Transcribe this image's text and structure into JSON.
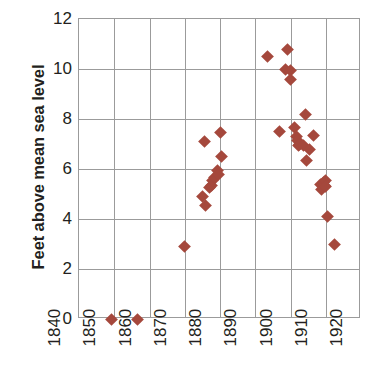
{
  "chart_data": {
    "type": "scatter",
    "title": "",
    "subtitle": "",
    "xlabel": "",
    "ylabel": "Feet above mean sea level",
    "xlim": [
      1840,
      1920
    ],
    "ylim": [
      0,
      12
    ],
    "xticks": [
      1840,
      1850,
      1860,
      1870,
      1880,
      1890,
      1900,
      1910,
      1920
    ],
    "yticks": [
      0,
      2,
      4,
      6,
      8,
      10,
      12
    ],
    "xtick_labels": [
      "1840",
      "1850",
      "1860",
      "1870",
      "1880",
      "1890",
      "1900",
      "1910",
      "1920"
    ],
    "ytick_labels": [
      "0",
      "2",
      "4",
      "6",
      "8",
      "10",
      "12"
    ],
    "grid": true,
    "legend": false,
    "legend_position": "none",
    "marker": "diamond",
    "marker_color": "#a5483c",
    "axis_color": "#9b9b9b",
    "text_color": "#231f20",
    "series": [
      {
        "name": "Lake level observations",
        "color": "#a5483c",
        "points": [
          [
            1849.2,
            0.0
          ],
          [
            1856.6,
            0.0
          ],
          [
            1869.8,
            2.9
          ],
          [
            1875.0,
            4.9
          ],
          [
            1875.6,
            7.1
          ],
          [
            1875.8,
            4.55
          ],
          [
            1877.0,
            5.25
          ],
          [
            1877.6,
            5.35
          ],
          [
            1878.0,
            5.55
          ],
          [
            1878.5,
            5.65
          ],
          [
            1879.2,
            5.95
          ],
          [
            1879.5,
            5.8
          ],
          [
            1880.0,
            7.45
          ],
          [
            1880.3,
            6.5
          ],
          [
            1893.5,
            10.5
          ],
          [
            1897.0,
            7.5
          ],
          [
            1898.5,
            10.0
          ],
          [
            1899.2,
            10.8
          ],
          [
            1900.0,
            9.95
          ],
          [
            1900.1,
            9.6
          ],
          [
            1901.2,
            7.65
          ],
          [
            1901.6,
            7.3
          ],
          [
            1902.0,
            7.15
          ],
          [
            1902.3,
            6.95
          ],
          [
            1902.6,
            7.0
          ],
          [
            1904.2,
            8.2
          ],
          [
            1903.8,
            6.95
          ],
          [
            1904.6,
            6.35
          ],
          [
            1905.4,
            6.8
          ],
          [
            1906.4,
            7.35
          ],
          [
            1908.6,
            5.4
          ],
          [
            1908.9,
            5.2
          ],
          [
            1909.3,
            5.45
          ],
          [
            1909.6,
            5.35
          ],
          [
            1909.8,
            5.55
          ],
          [
            1910.0,
            5.3
          ],
          [
            1910.6,
            4.1
          ],
          [
            1912.6,
            3.0
          ]
        ]
      }
    ]
  }
}
